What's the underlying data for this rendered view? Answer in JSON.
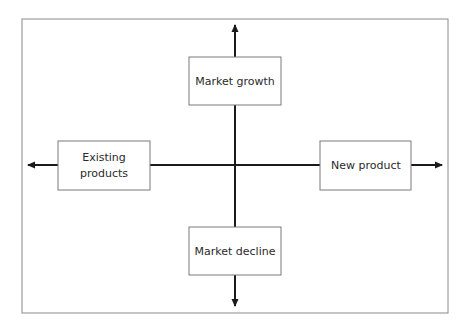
{
  "diagram": {
    "boxes": [
      {
        "id": "top",
        "lines": [
          "Market growth"
        ]
      },
      {
        "id": "left",
        "lines": [
          "Existing",
          "products"
        ]
      },
      {
        "id": "right",
        "lines": [
          "New product"
        ]
      },
      {
        "id": "bottom",
        "lines": [
          "Market decline"
        ]
      }
    ],
    "colors": {
      "frame": "#8a8a8a",
      "box_border": "#7a7a7a",
      "axis": "#1a1a1a",
      "text": "#2a2a2a",
      "background": "#ffffff"
    }
  }
}
